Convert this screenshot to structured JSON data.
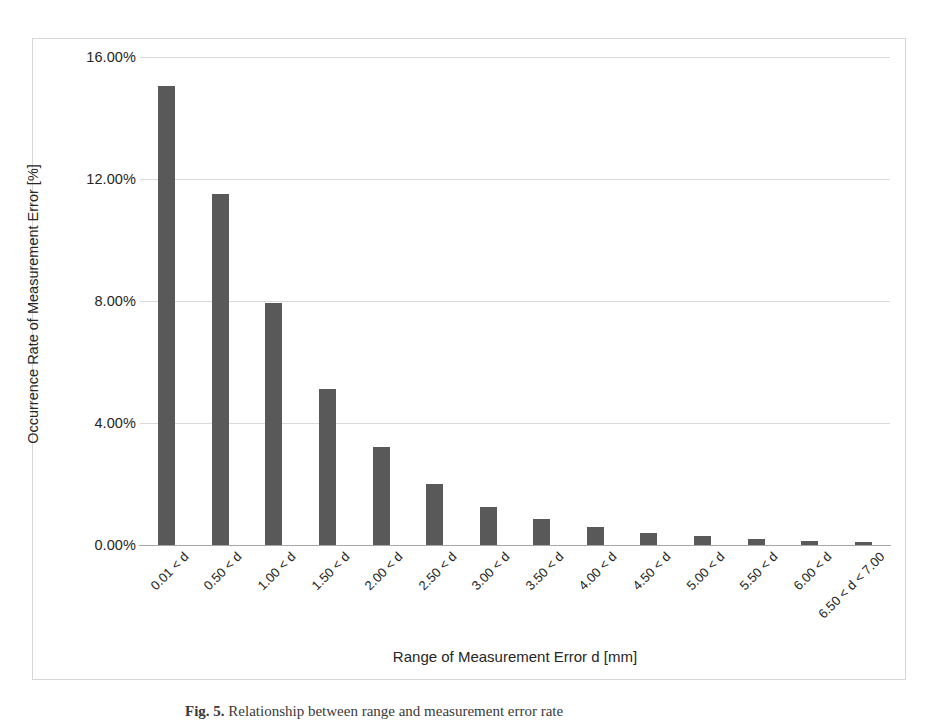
{
  "figure": {
    "caption_label": "Fig. 5.",
    "caption_text": "Relationship between range and measurement error rate",
    "frame_color": "#d6d6d6"
  },
  "chart_data": {
    "type": "bar",
    "title": "",
    "xlabel": "Range of Measurement Error d [mm]",
    "ylabel": "Occurrence Rate of Measurement Error [%]",
    "ylim": [
      0,
      16
    ],
    "ytick_labels": [
      "16.00%",
      "12.00%",
      "8.00%",
      "4.00%",
      "0.00%"
    ],
    "ytick_values": [
      16,
      12,
      8,
      4,
      0
    ],
    "grid": true,
    "legend": "none",
    "bar_color": "#595959",
    "gridline_color": "#d9d9d9",
    "axis_color": "#a6a6a6",
    "categories": [
      "0.01 < d",
      "0.50 < d",
      "1.00 < d",
      "1.50 < d",
      "2.00 < d",
      "2.50 < d",
      "3.00 < d",
      "3.50 < d",
      "4.00 < d",
      "4.50 < d",
      "5.00 < d",
      "5.50 < d",
      "6.00 < d",
      "6.50 < d < 7.00"
    ],
    "values": [
      15.05,
      11.5,
      7.95,
      5.1,
      3.2,
      2.0,
      1.25,
      0.85,
      0.58,
      0.38,
      0.28,
      0.2,
      0.12,
      0.1
    ]
  }
}
